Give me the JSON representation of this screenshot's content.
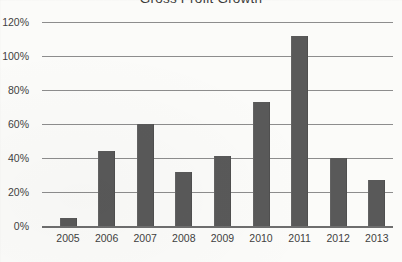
{
  "chart_data": {
    "type": "bar",
    "title": "Gross Profit Growth",
    "xlabel": "",
    "ylabel": "",
    "categories": [
      "2005",
      "2006",
      "2007",
      "2008",
      "2009",
      "2010",
      "2011",
      "2012",
      "2013"
    ],
    "values": [
      5,
      44,
      60,
      32,
      41,
      73,
      112,
      40,
      27
    ],
    "value_suffix": "%",
    "ylim": [
      0,
      120
    ],
    "ytick_step": 20,
    "ytick_labels": [
      "0%",
      "20%",
      "40%",
      "60%",
      "80%",
      "100%",
      "120%"
    ],
    "ytick_values": [
      0,
      20,
      40,
      60,
      80,
      100,
      120
    ],
    "grid": true,
    "legend": false,
    "legend_position": "none",
    "series": [
      {
        "name": "Gross Profit Growth",
        "values": [
          5,
          44,
          60,
          32,
          41,
          73,
          112,
          40,
          27
        ]
      }
    ],
    "colors": {
      "bar": "#595959",
      "gridline": "#8d8d8d",
      "axis": "#6e6e6e",
      "text": "#3f3f3f",
      "background": "#fbfbf9"
    }
  }
}
